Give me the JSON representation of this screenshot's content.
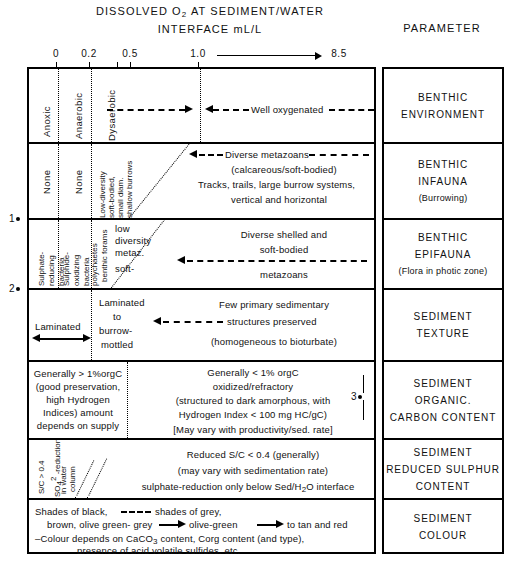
{
  "header": {
    "title_line1": "DISSOLVED O2 AT SEDIMENT/WATER",
    "title_line2": "INTERFACE mL/L",
    "parameter_title": "PARAMETER"
  },
  "scale": {
    "ticks": [
      "0",
      "0.2",
      "0.5",
      "1.0",
      "8.5"
    ],
    "arrow_from": "1.0",
    "arrow_to": "8.5"
  },
  "oxygen_zones": {
    "anoxic": "Anoxic",
    "anaerobic": "Anaerobic",
    "dysaerobic": "Dysaerobic",
    "well_oxygenated": "Well oxygenated"
  },
  "rows": [
    {
      "parameter": [
        "BENTHIC",
        "ENVIRONMENT"
      ],
      "parameter_note": "",
      "cells": {
        "anoxic": "Anoxic",
        "anaerobic": "Anaerobic",
        "dysaerobic": "Dysaerobic",
        "main": "Well oxygenated"
      }
    },
    {
      "parameter": [
        "BENTHIC",
        "INFAUNA"
      ],
      "parameter_note": "(Burrowing)",
      "cells": {
        "anoxic": "None",
        "anaerobic": "None",
        "dysaerobic": "Low-diversity soft-bodied, small diam. shallow burrows",
        "main_lines": [
          "Diverse metazoans",
          "(calcareous/soft-bodied)",
          "Tracks, trails, large burrow systems,",
          "vertical and horizontal"
        ]
      }
    },
    {
      "parameter": [
        "BENTHIC",
        "EPIFAUNA"
      ],
      "parameter_note": "(Flora in photic zone)",
      "cells": {
        "anoxic": "Sulphate- reducing bacteria",
        "anaerobic": "Sulphide- oxidizing bacteria",
        "dysaerobic_a": "polychaetes",
        "dysaerobic_b": "benthic forams",
        "dysaerobic_text": [
          "low",
          "diversity",
          "metaz.",
          "soft-"
        ],
        "main_lines": [
          "Diverse shelled and",
          "soft-bodied",
          "metazoans"
        ]
      }
    },
    {
      "parameter": [
        "SEDIMENT",
        "TEXTURE"
      ],
      "parameter_note": "",
      "cells": {
        "anoxic": "Laminated",
        "middle": [
          "Laminated",
          "to",
          "burrow-",
          "mottled"
        ],
        "main_lines": [
          "Few primary sedimentary",
          "structures preserved",
          "(homogeneous to bioturbate)"
        ]
      }
    },
    {
      "parameter": [
        "SEDIMENT",
        "ORGANIC.",
        "CARBON CONTENT"
      ],
      "parameter_note": "",
      "cells": {
        "left_lines": [
          "Generally > 1%orgC",
          "(good preservation,",
          "high Hydrogen",
          "Indices) amount",
          "depends on supply"
        ],
        "main_lines": [
          "Generally  <  1% orgC",
          "oxidized/refractory",
          "(structured to dark amorphous, with",
          "Hydrogen Index  <  100 mg HC/gC)",
          "[May vary with productivity/sed. rate]"
        ]
      }
    },
    {
      "parameter": [
        "SEDIMENT",
        "REDUCED SULPHUR",
        "CONTENT"
      ],
      "parameter_note": "",
      "cells": {
        "left_a": "S/C > 0.4",
        "left_b": "SO4 2 -reduction",
        "left_c": "in water column",
        "main_lines": [
          "Reduced S/C < 0.4 (generally)",
          "(may vary with sedimentation rate)",
          "sulphate-reduction only below Sed/H2O interface"
        ]
      }
    },
    {
      "parameter": [
        "SEDIMENT",
        "COLOUR"
      ],
      "parameter_note": "",
      "cells": {
        "line1": "Shades of black,",
        "line1b": "shades of grey,",
        "line2": "brown, olive green- grey",
        "line2b": "olive-green",
        "line2c": "to tan and red",
        "line3": "-Colour depends on CaCO3 content, Corg content (and type),",
        "line4": "presence  of acid volatile sulfides, etc."
      }
    }
  ],
  "footnote_markers": {
    "one": "1",
    "two": "2",
    "three": "3"
  }
}
